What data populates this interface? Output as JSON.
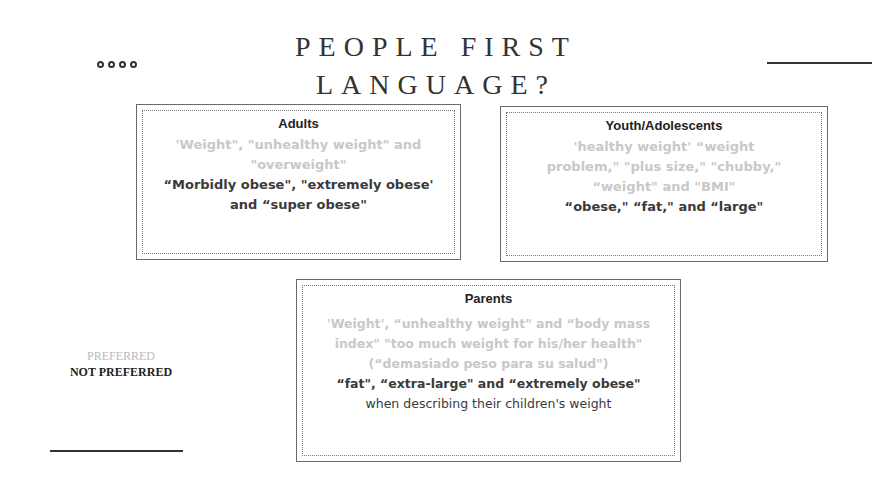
{
  "header": {
    "title_line1": "PEOPLE FIRST",
    "title_line2": "LANGUAGE?",
    "decoration_icon": "four-circles"
  },
  "boxes": {
    "adults": {
      "title": "Adults",
      "preferred": "'Weight\", \"unhealthy weight\" and \"overweight\"",
      "not_preferred": "“Morbidly obese\", \"extremely obese' and “super obese\"",
      "extra": ""
    },
    "youth": {
      "title": "Youth/Adolescents",
      "preferred": "'healthy weight' “weight problem,\" \"plus size,\" \"chubby,\" “weight\" and \"BMI\"",
      "not_preferred": "“obese,\" “fat,\" and “large\"",
      "extra": ""
    },
    "parents": {
      "title": "Parents",
      "preferred": "'Weight', “unhealthy weight\" and “body mass index\" \"too much weight for his/her health\" (“demasiado peso para su salud\")",
      "not_preferred": "“fat\", “extra-large\" and “extremely obese\"",
      "extra": "when describing their children's weight"
    }
  },
  "legend": {
    "preferred_label": "PREFERRED",
    "not_preferred_label": "NOT PREFERRED"
  },
  "colors": {
    "preferred_text": "#c8c8c8",
    "not_preferred_text": "#3a3a3a",
    "border": "#6a6a6a"
  }
}
